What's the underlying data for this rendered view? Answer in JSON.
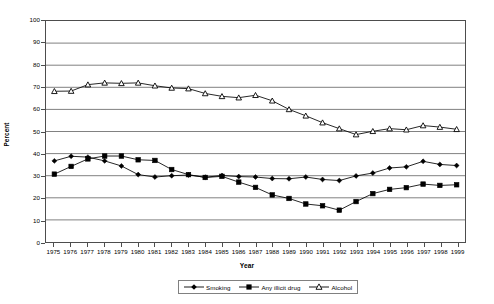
{
  "chart_data": {
    "type": "line",
    "title": "",
    "xlabel": "Year",
    "ylabel": "Percent",
    "ylim": [
      0,
      100
    ],
    "ytick_step": 10,
    "yticks": [
      0,
      10,
      20,
      30,
      40,
      50,
      60,
      70,
      80,
      90,
      100
    ],
    "grid": "horizontal",
    "legend_position": "bottom-center",
    "categories": [
      "1975",
      "1976",
      "1977",
      "1978",
      "1979",
      "1980",
      "1981",
      "1982",
      "1983",
      "1984",
      "1985",
      "1986",
      "1987",
      "1988",
      "1989",
      "1990",
      "1991",
      "1992",
      "1993",
      "1994",
      "1995",
      "1996",
      "1997",
      "1998",
      "1999"
    ],
    "x": [
      "1975",
      "1976",
      "1977",
      "1978",
      "1979",
      "1980",
      "1981",
      "1982",
      "1983",
      "1984",
      "1985",
      "1986",
      "1987",
      "1988",
      "1989",
      "1990",
      "1991",
      "1992",
      "1993",
      "1994",
      "1995",
      "1996",
      "1997",
      "1998",
      "1999"
    ],
    "series": [
      {
        "name": "Smoking",
        "marker": "diamond",
        "color": "#000000",
        "values": [
          36.7,
          38.8,
          38.4,
          36.7,
          34.4,
          30.5,
          29.4,
          30.0,
          30.3,
          29.3,
          30.1,
          29.6,
          29.4,
          28.7,
          28.6,
          29.4,
          28.3,
          27.8,
          29.9,
          31.2,
          33.5,
          34.0,
          36.5,
          35.1,
          34.6
        ]
      },
      {
        "name": "Any illicit drug",
        "marker": "square",
        "color": "#000000",
        "values": [
          30.7,
          34.2,
          37.6,
          38.9,
          38.9,
          37.2,
          36.9,
          32.8,
          30.5,
          29.2,
          29.7,
          27.1,
          24.7,
          21.3,
          19.7,
          17.2,
          16.4,
          14.4,
          18.3,
          21.9,
          23.8,
          24.6,
          26.2,
          25.6,
          25.9
        ]
      },
      {
        "name": "Alcohol",
        "marker": "triangle",
        "color": "#000000",
        "values": [
          68.2,
          68.3,
          71.2,
          72.0,
          71.8,
          72.0,
          70.7,
          69.7,
          69.4,
          67.2,
          65.9,
          65.3,
          66.4,
          63.9,
          60.0,
          57.1,
          54.0,
          51.3,
          48.6,
          50.1,
          51.3,
          50.8,
          52.7,
          52.0,
          51.0
        ]
      }
    ]
  },
  "legend": {
    "items": [
      {
        "label": "Smoking",
        "marker": "diamond"
      },
      {
        "label": "Any illicit drug",
        "marker": "square"
      },
      {
        "label": "Alcohol",
        "marker": "triangle"
      }
    ]
  },
  "axes": {
    "y_title": "Percent",
    "x_title": "Year"
  }
}
